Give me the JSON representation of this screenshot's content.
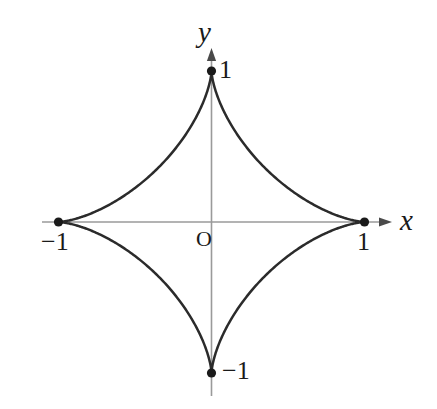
{
  "figure": {
    "name": "astroid-curve-plot",
    "background_color": "#ffffff",
    "curve_color": "#2b2b2b",
    "axis_color": "#9a9a9a",
    "label_color": "#1a1a1a"
  },
  "labels": {
    "x_axis_name": "x",
    "y_axis_name": "y",
    "origin": "O",
    "x_positive_tick": "1",
    "x_negative_tick": "−1",
    "y_positive_tick": "1",
    "y_negative_tick": "−1"
  },
  "chart_data": {
    "type": "line",
    "title": "",
    "xlabel": "x",
    "ylabel": "y",
    "xlim": [
      -1.4,
      1.4
    ],
    "ylim": [
      -1.4,
      1.4
    ],
    "grid": false,
    "legend": "none",
    "curve_equation": "x^(2/3) + y^(2/3) = 1",
    "curve_name": "astroid",
    "parametric": {
      "x": "cos(t)^3",
      "y": "sin(t)^3",
      "t_range": [
        0,
        6.283185307179586
      ]
    },
    "annotations": [
      {
        "label": "1",
        "x": 0,
        "y": 1
      },
      {
        "label": "1",
        "x": 1,
        "y": 0
      },
      {
        "label": "−1",
        "x": -1,
        "y": 0
      },
      {
        "label": "−1",
        "x": 0,
        "y": -1
      },
      {
        "label": "O",
        "x": 0,
        "y": 0
      }
    ],
    "marked_points": [
      {
        "x": 0,
        "y": 1
      },
      {
        "x": 1,
        "y": 0
      },
      {
        "x": 0,
        "y": -1
      },
      {
        "x": -1,
        "y": 0
      }
    ],
    "series": [
      {
        "name": "astroid",
        "x": [
          1.0,
          0.9848,
          0.9397,
          0.866,
          0.766,
          0.6428,
          0.5,
          0.342,
          0.1736,
          0.0,
          -0.1736,
          -0.342,
          -0.5,
          -0.6428,
          -0.766,
          -0.866,
          -0.9397,
          -0.9848,
          -1.0,
          -0.9848,
          -0.9397,
          -0.866,
          -0.766,
          -0.6428,
          -0.5,
          -0.342,
          -0.1736,
          0.0,
          0.1736,
          0.342,
          0.5,
          0.6428,
          0.766,
          0.866,
          0.9397,
          0.9848,
          1.0
        ],
        "y": [
          0.0,
          0.0052,
          0.0403,
          0.125,
          0.262,
          0.4397,
          0.6495,
          0.829,
          0.9477,
          1.0,
          0.9477,
          0.829,
          0.6495,
          0.4397,
          0.262,
          0.125,
          0.0403,
          0.0052,
          0.0,
          -0.0052,
          -0.0403,
          -0.125,
          -0.262,
          -0.4397,
          -0.6495,
          -0.829,
          -0.9477,
          -1.0,
          -0.9477,
          -0.829,
          -0.6495,
          -0.4397,
          -0.262,
          -0.125,
          -0.0403,
          -0.0052,
          0.0
        ]
      }
    ],
    "axes_geometry": {
      "origin_px": [
        211.5,
        222
      ],
      "unit_px_x": 153,
      "unit_px_y": 151,
      "x_axis_span_px": [
        42,
        392
      ],
      "y_axis_span_px": [
        48,
        396
      ],
      "x_arrow": "right",
      "y_arrow": "up"
    }
  }
}
